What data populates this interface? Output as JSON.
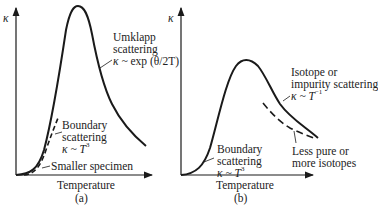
{
  "panel_a": {
    "y_axis_label": "κ",
    "x_axis_label": "Temperature",
    "caption": "(a)",
    "umklapp": {
      "line1": "Umklapp",
      "line2": "scattering",
      "formula_prefix": "κ ~",
      "formula_rest": "exp (θ/2T)"
    },
    "boundary": {
      "line1": "Boundary",
      "line2": "scattering",
      "formula": "κ ~ T",
      "exponent": "3"
    },
    "smaller_specimen": "Smaller specimen"
  },
  "panel_b": {
    "y_axis_label": "κ",
    "x_axis_label": "Temperature",
    "caption": "(b)",
    "isotope": {
      "line1": "Isotope or",
      "line2": "impurity scattering",
      "formula": "κ ~ T",
      "exponent": "−1"
    },
    "boundary": {
      "line1": "Boundary",
      "line2": "scattering",
      "formula": "κ ~ T",
      "exponent": "3"
    },
    "less_pure": {
      "line1": "Less pure or",
      "line2": "more isotopes"
    }
  },
  "colors": {
    "ink": "#1a1a1a",
    "background": "#ffffff"
  }
}
